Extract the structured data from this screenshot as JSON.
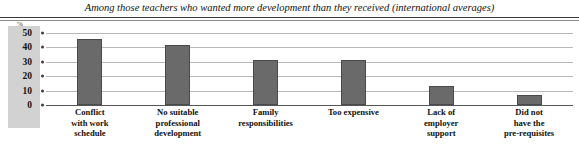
{
  "chart_data": {
    "type": "bar",
    "title": "Among those teachers who wanted more development than they received (international averages)",
    "xlabel": "",
    "ylabel": "%",
    "unit_label": "%",
    "ylim": [
      0,
      56
    ],
    "yticks": [
      0,
      10,
      20,
      30,
      40,
      50
    ],
    "ytick_labels": [
      "0",
      "10",
      "20",
      "30",
      "40",
      "50"
    ],
    "grid": true,
    "legend": "none",
    "categories": [
      "Conflict with work schedule",
      "No suitable professional development",
      "Family responsibilities",
      "Too expensive",
      "Lack of employer support",
      "Did not have the pre-requisites"
    ],
    "category_lines": [
      [
        "Conflict",
        "with work",
        "schedule"
      ],
      [
        "No suitable",
        "professional",
        "development"
      ],
      [
        "Family",
        "responsibilities"
      ],
      [
        "Too expensive"
      ],
      [
        "Lack of",
        "employer",
        "support"
      ],
      [
        "Did not",
        "have the",
        "pre-requisites"
      ]
    ],
    "values": [
      46,
      42,
      31,
      31,
      13,
      7
    ],
    "series": [
      {
        "name": "International average",
        "values": [
          46,
          42,
          31,
          31,
          13,
          7
        ]
      }
    ],
    "colors": {
      "bar_fill": "#6a6a6a",
      "bar_stroke": "#4a4a4a",
      "gridline": "#b9b9b9",
      "axis_line": "#55565a",
      "axis_panel": "#d2d2d2",
      "text": "#111111",
      "background": "#ffffff"
    }
  }
}
